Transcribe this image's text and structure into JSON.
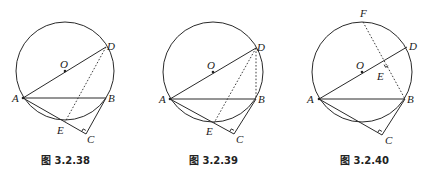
{
  "figures": [
    {
      "caption": "图 3.2.38",
      "circle": {
        "cx": 65,
        "cy": 71,
        "r": 49
      },
      "points": {
        "O": {
          "x": 65,
          "y": 71,
          "label": "O"
        },
        "A": {
          "x": 23,
          "y": 98,
          "label": "A"
        },
        "B": {
          "x": 106,
          "y": 98,
          "label": "B"
        },
        "D": {
          "x": 106,
          "y": 47,
          "label": "D"
        },
        "E": {
          "x": 65,
          "y": 122,
          "label": "E"
        },
        "C": {
          "x": 86,
          "y": 134,
          "label": "C"
        }
      },
      "solid_segments": [
        "AD",
        "AB",
        "AC",
        "BC"
      ],
      "dashed_segments": [
        "DE"
      ],
      "right_angle_at": "C"
    },
    {
      "caption": "图 3.2.39",
      "circle": {
        "cx": 213,
        "cy": 72,
        "r": 50
      },
      "points": {
        "O": {
          "x": 213,
          "y": 72,
          "label": "O"
        },
        "A": {
          "x": 170,
          "y": 99,
          "label": "A"
        },
        "B": {
          "x": 256,
          "y": 99,
          "label": "B"
        },
        "D": {
          "x": 256,
          "y": 48,
          "label": "D"
        },
        "E": {
          "x": 214,
          "y": 123,
          "label": "E"
        },
        "C": {
          "x": 234,
          "y": 134,
          "label": "C"
        }
      },
      "solid_segments": [
        "AD",
        "AB",
        "AC",
        "BC"
      ],
      "dashed_segments": [
        "DE",
        "DB"
      ],
      "right_angle_at": "C"
    },
    {
      "caption": "图 3.2.40",
      "circle": {
        "cx": 362,
        "cy": 72,
        "r": 50
      },
      "points": {
        "O": {
          "x": 362,
          "y": 72,
          "label": "O"
        },
        "A": {
          "x": 319,
          "y": 99,
          "label": "A"
        },
        "B": {
          "x": 405,
          "y": 99,
          "label": "B"
        },
        "D": {
          "x": 407,
          "y": 47,
          "label": "D"
        },
        "F": {
          "x": 363,
          "y": 22,
          "label": "F"
        },
        "E": {
          "x": 386,
          "y": 62,
          "label": "E"
        },
        "C": {
          "x": 382,
          "y": 135,
          "label": "C"
        }
      },
      "solid_segments": [
        "AD",
        "AB",
        "AC",
        "BC"
      ],
      "dashed_segments": [
        "FB"
      ],
      "right_angle_at": [
        "C",
        "E"
      ]
    }
  ]
}
